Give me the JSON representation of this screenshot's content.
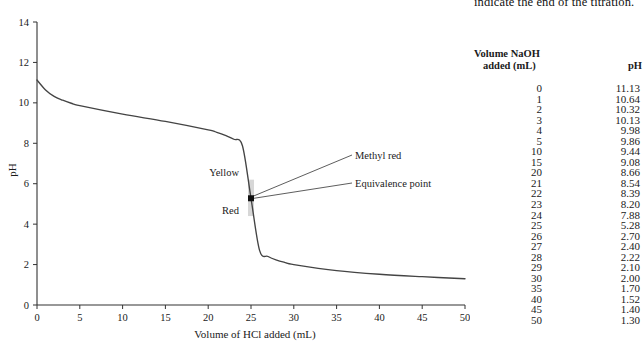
{
  "caption": {
    "tail_text": "indicate the end of the titration."
  },
  "chart_data": {
    "type": "line",
    "title": "",
    "xlabel": "Volume of HCl added (mL)",
    "ylabel": "pH",
    "xlim": [
      0,
      50
    ],
    "ylim": [
      0,
      14
    ],
    "xticks": [
      0,
      5,
      10,
      15,
      20,
      25,
      30,
      35,
      40,
      45,
      50
    ],
    "yticks": [
      0,
      2,
      4,
      6,
      8,
      10,
      12,
      14
    ],
    "grid": false,
    "legend": "none",
    "curve_color": "#444444",
    "x": [
      0,
      1,
      2,
      3,
      4,
      5,
      10,
      15,
      20,
      21,
      22,
      23,
      24,
      25,
      26,
      27,
      28,
      29,
      30,
      35,
      40,
      45,
      50
    ],
    "y": [
      11.13,
      10.64,
      10.32,
      10.13,
      9.98,
      9.86,
      9.44,
      9.08,
      8.66,
      8.54,
      8.39,
      8.2,
      7.88,
      5.28,
      2.7,
      2.4,
      2.22,
      2.1,
      2.0,
      1.7,
      1.52,
      1.4,
      1.3
    ],
    "annotations": [
      {
        "name": "methyl-red",
        "text": "Methyl red",
        "x": 25.0,
        "y": 6.2
      },
      {
        "name": "equivalence-point",
        "text": "Equivalence point",
        "x": 25.0,
        "y": 5.28
      },
      {
        "name": "yellow-region",
        "text": "Yellow",
        "x": 22.0,
        "y": 6.3
      },
      {
        "name": "red-region",
        "text": "Red",
        "x": 22.5,
        "y": 4.3
      }
    ],
    "indicator_band": {
      "name": "methyl-red-band",
      "x": 25.0,
      "y_low": 4.4,
      "y_high": 6.2,
      "color": "#c9c9c9"
    }
  },
  "table": {
    "header_volume_line1": "Volume NaOH",
    "header_volume_line2": "added (mL)",
    "header_ph": "pH",
    "rows": [
      {
        "volume": "0",
        "ph": "11.13"
      },
      {
        "volume": "1",
        "ph": "10.64"
      },
      {
        "volume": "2",
        "ph": "10.32"
      },
      {
        "volume": "3",
        "ph": "10.13"
      },
      {
        "volume": "4",
        "ph": "9.98"
      },
      {
        "volume": "5",
        "ph": "9.86"
      },
      {
        "volume": "10",
        "ph": "9.44"
      },
      {
        "volume": "15",
        "ph": "9.08"
      },
      {
        "volume": "20",
        "ph": "8.66"
      },
      {
        "volume": "21",
        "ph": "8.54"
      },
      {
        "volume": "22",
        "ph": "8.39"
      },
      {
        "volume": "23",
        "ph": "8.20"
      },
      {
        "volume": "24",
        "ph": "7.88"
      },
      {
        "volume": "25",
        "ph": "5.28"
      },
      {
        "volume": "26",
        "ph": "2.70"
      },
      {
        "volume": "27",
        "ph": "2.40"
      },
      {
        "volume": "28",
        "ph": "2.22"
      },
      {
        "volume": "29",
        "ph": "2.10"
      },
      {
        "volume": "30",
        "ph": "2.00"
      },
      {
        "volume": "35",
        "ph": "1.70"
      },
      {
        "volume": "40",
        "ph": "1.52"
      },
      {
        "volume": "45",
        "ph": "1.40"
      },
      {
        "volume": "50",
        "ph": "1.30"
      }
    ]
  }
}
